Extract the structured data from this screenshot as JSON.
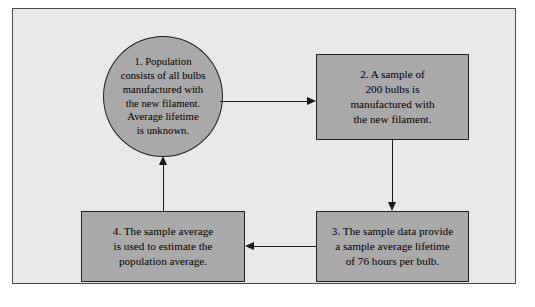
{
  "diagram": {
    "frame": {
      "background_color": "#e9e9e9",
      "border_color": "#4a4a4a"
    },
    "node_fill_color": "#a9a9a9",
    "node_border_color": "#222222",
    "connector_color": "#1a1a1a",
    "nodes": [
      {
        "id": "population",
        "shape": "circle",
        "step": "1.",
        "text": "1.  Population\nconsists of all bulbs\nmanufactured with\nthe new filament.\nAverage lifetime\nis unknown."
      },
      {
        "id": "sample",
        "shape": "rectangle",
        "step": "2.",
        "text": "2.  A sample of\n200 bulbs is\nmanufactured with\nthe new filament."
      },
      {
        "id": "data",
        "shape": "rectangle",
        "step": "3.",
        "text": "3.  The sample data provide\na sample average lifetime\nof 76 hours per bulb."
      },
      {
        "id": "estimate",
        "shape": "rectangle",
        "step": "4.",
        "text": "4.  The sample average\nis used to estimate the\npopulation average."
      }
    ],
    "connectors": [
      {
        "id": "pop-to-sample",
        "from": "population",
        "to": "sample",
        "direction": "right"
      },
      {
        "id": "sample-to-data",
        "from": "sample",
        "to": "data",
        "direction": "down"
      },
      {
        "id": "data-to-estimate",
        "from": "data",
        "to": "estimate",
        "direction": "left"
      },
      {
        "id": "estimate-to-pop",
        "from": "estimate",
        "to": "population",
        "direction": "up"
      }
    ]
  }
}
